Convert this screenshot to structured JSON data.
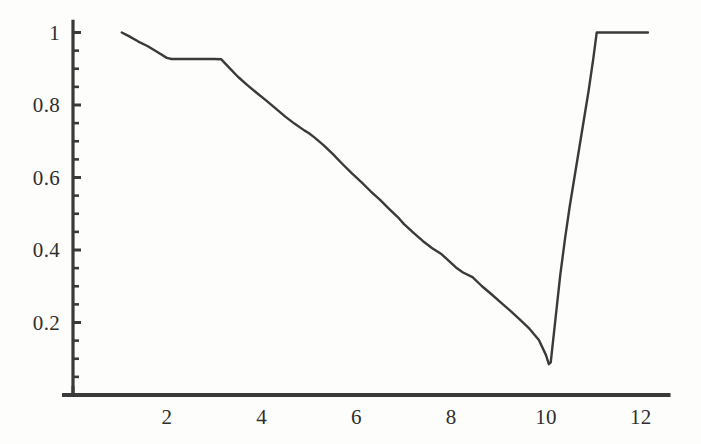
{
  "chart_data": {
    "type": "line",
    "title": "",
    "xlabel": "",
    "ylabel": "",
    "xlim": [
      0,
      12.4
    ],
    "ylim": [
      0,
      1.06
    ],
    "grid": false,
    "legend": null,
    "axis_style": "two-axis-spines-left-bottom",
    "line_color": "#3a3a3a",
    "line_width": 2.4,
    "background": "#fdfdfc",
    "x_ticks_major": [
      2,
      4,
      6,
      8,
      10,
      12
    ],
    "x_tick_labels": [
      "2",
      "4",
      "6",
      "8",
      "10",
      "12"
    ],
    "y_ticks_major": [
      0.2,
      0.4,
      0.6,
      0.8,
      1
    ],
    "y_tick_labels": [
      "0.2",
      "0.4",
      "0.6",
      "0.8",
      "1"
    ],
    "y_ticks_minor": [
      0.05,
      0.1,
      0.15,
      0.25,
      0.3,
      0.35,
      0.45,
      0.5,
      0.55,
      0.65,
      0.7,
      0.75,
      0.85,
      0.9,
      0.95
    ],
    "x_axis_extent": [
      0,
      12.5
    ],
    "y_axis_extent": [
      0,
      1.03
    ],
    "series": [
      {
        "name": "curve",
        "x": [
          1.05,
          1.2,
          1.4,
          1.6,
          1.8,
          2.0,
          2.1,
          2.4,
          2.7,
          3.0,
          3.15,
          3.3,
          3.5,
          3.7,
          3.9,
          4.1,
          4.3,
          4.5,
          4.7,
          4.9,
          5.0,
          5.1,
          5.3,
          5.5,
          5.7,
          5.9,
          6.1,
          6.3,
          6.5,
          6.7,
          6.9,
          7.0,
          7.2,
          7.4,
          7.6,
          7.8,
          7.95,
          8.1,
          8.25,
          8.45,
          8.65,
          8.85,
          9.05,
          9.25,
          9.45,
          9.65,
          9.85,
          10.0,
          10.06,
          10.1,
          10.2,
          10.3,
          10.4,
          10.5,
          10.6,
          10.7,
          10.8,
          10.9,
          11.0,
          11.07,
          11.5,
          12.15
        ],
        "y": [
          1.0,
          0.99,
          0.975,
          0.962,
          0.946,
          0.93,
          0.927,
          0.927,
          0.927,
          0.927,
          0.926,
          0.905,
          0.878,
          0.855,
          0.833,
          0.812,
          0.79,
          0.768,
          0.748,
          0.73,
          0.722,
          0.712,
          0.69,
          0.665,
          0.638,
          0.612,
          0.588,
          0.562,
          0.538,
          0.512,
          0.487,
          0.472,
          0.448,
          0.425,
          0.405,
          0.388,
          0.37,
          0.352,
          0.338,
          0.325,
          0.3,
          0.278,
          0.255,
          0.232,
          0.208,
          0.183,
          0.152,
          0.11,
          0.085,
          0.09,
          0.21,
          0.33,
          0.43,
          0.52,
          0.6,
          0.68,
          0.76,
          0.84,
          0.93,
          1.0,
          1.0,
          1.0
        ]
      }
    ],
    "annotations": {
      "plateau_high_left": {
        "x_range": [
          2.1,
          3.15
        ],
        "y": 0.927
      },
      "minimum": {
        "x": 10.06,
        "y": 0.085
      },
      "plateau_top_right": {
        "x_range": [
          11.07,
          12.15
        ],
        "y": 1.0
      }
    }
  }
}
